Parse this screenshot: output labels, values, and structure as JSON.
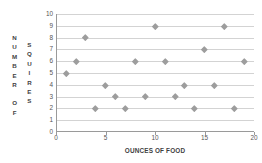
{
  "chart_data": {
    "type": "scatter",
    "title": "",
    "xlabel": "OUNCES OF FOOD",
    "ylabel": "NUMBER OF SQUIRES",
    "ylabel_columns": [
      [
        "N",
        "U",
        "M",
        "B",
        "E",
        "R",
        "",
        "O",
        "F"
      ],
      [
        "S",
        "Q",
        "U",
        "I",
        "R",
        "E",
        "S"
      ]
    ],
    "x": [
      1,
      2,
      3,
      4,
      5,
      6,
      7,
      8,
      9,
      10,
      11,
      12,
      13,
      14,
      15,
      16,
      17,
      18,
      19
    ],
    "y": [
      5,
      6,
      8,
      2,
      4,
      3,
      2,
      6,
      3,
      9,
      6,
      3,
      4,
      2,
      7,
      4,
      9,
      2,
      6
    ],
    "points": [
      {
        "x": 1,
        "y": 5
      },
      {
        "x": 2,
        "y": 6
      },
      {
        "x": 3,
        "y": 8
      },
      {
        "x": 4,
        "y": 2
      },
      {
        "x": 5,
        "y": 4
      },
      {
        "x": 6,
        "y": 3
      },
      {
        "x": 7,
        "y": 2
      },
      {
        "x": 8,
        "y": 6
      },
      {
        "x": 9,
        "y": 3
      },
      {
        "x": 10,
        "y": 9
      },
      {
        "x": 11,
        "y": 6
      },
      {
        "x": 12,
        "y": 3
      },
      {
        "x": 13,
        "y": 4
      },
      {
        "x": 14,
        "y": 2
      },
      {
        "x": 15,
        "y": 7
      },
      {
        "x": 16,
        "y": 4
      },
      {
        "x": 17,
        "y": 9
      },
      {
        "x": 18,
        "y": 2
      },
      {
        "x": 19,
        "y": 6
      }
    ],
    "xlim": [
      0,
      20
    ],
    "ylim": [
      0,
      10
    ],
    "xticks": [
      0,
      5,
      10,
      15,
      20
    ],
    "xtick_labels": [
      "0",
      "5",
      "10",
      "15",
      "20"
    ],
    "yticks": [
      0,
      1,
      2,
      3,
      4,
      5,
      6,
      7,
      8,
      9,
      10
    ],
    "ytick_labels": [
      "0",
      "1",
      "2",
      "3",
      "4",
      "5",
      "6",
      "7",
      "8",
      "9",
      "10"
    ],
    "grid": "horizontal",
    "legend": null,
    "marker": "diamond",
    "colors": {
      "marker": "#9d9d9d",
      "gridline": "#d3d3d3",
      "axis": "#9a9a9a",
      "text": "#3f3f3f",
      "background": "#ffffff"
    }
  }
}
